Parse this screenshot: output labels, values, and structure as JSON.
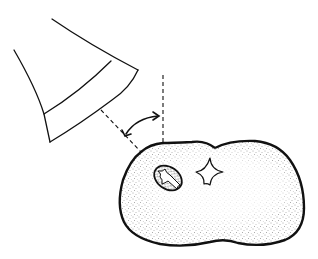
{
  "figure": {
    "type": "line-illustration",
    "elements": [
      {
        "name": "x-ray-cone",
        "description": "open-ended conical tube with banded rim, angled downward to the right"
      },
      {
        "name": "central-ray",
        "description": "dashed line extending from cone center toward tooth surface"
      },
      {
        "name": "vertical-reference",
        "description": "dashed vertical line perpendicular at tooth surface"
      },
      {
        "name": "angle-arrow",
        "description": "curved double-headed arrow between central ray and vertical reference"
      },
      {
        "name": "tooth-cross-section",
        "description": "stippled kidney-shaped cross-section with thick outline"
      },
      {
        "name": "pulp-canal-oval",
        "description": "small stippled oval with star-shaped canal at left"
      },
      {
        "name": "pulp-canal-star",
        "description": "four-pointed star-shaped canal opening at center"
      }
    ],
    "colors": {
      "ink": "#111111",
      "background": "#ffffff",
      "stipple": "#555555"
    }
  },
  "labels": {
    "accessible_title": "Illustration of x-ray beam angulation relative to tooth"
  }
}
